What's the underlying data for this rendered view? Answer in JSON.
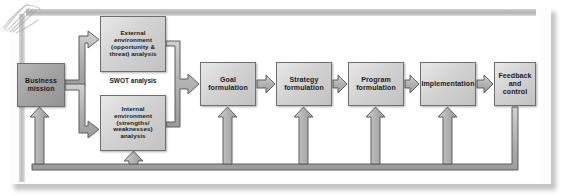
{
  "diagram": {
    "type": "process-flow",
    "nodes": [
      {
        "id": "mission",
        "label": "Business mission",
        "emphasis": "dark"
      },
      {
        "id": "external",
        "label": "External environment (opportunity & threat) analysis",
        "emphasis": "light"
      },
      {
        "id": "internal",
        "label": "Internal environment (strengths/ weaknesses) analysis",
        "emphasis": "light"
      },
      {
        "id": "goal",
        "label": "Goal formulation",
        "emphasis": "light"
      },
      {
        "id": "strategy",
        "label": "Strategy formulation",
        "emphasis": "light"
      },
      {
        "id": "program",
        "label": "Program formulation",
        "emphasis": "light"
      },
      {
        "id": "implement",
        "label": "Implementation",
        "emphasis": "light"
      },
      {
        "id": "feedback",
        "label": "Feedback and control",
        "emphasis": "light"
      }
    ],
    "labels": {
      "swot": "SWOT analysis"
    },
    "node_text": {
      "mission": [
        "Business",
        "mission"
      ],
      "external": [
        "External",
        "environment",
        "(opportunity &",
        "threat) analysis"
      ],
      "internal": [
        "Internal",
        "environment",
        "(strengths/",
        "weaknesses) analysis"
      ],
      "goal": [
        "Goal",
        "formulation"
      ],
      "strategy": [
        "Strategy",
        "formulation"
      ],
      "program": [
        "Program",
        "formulation"
      ],
      "implement": [
        "Implementation"
      ],
      "feedback": [
        "Feedback",
        "and",
        "control"
      ]
    },
    "edges": [
      {
        "from": "mission",
        "to": "external",
        "style": "block-arrow"
      },
      {
        "from": "mission",
        "to": "internal",
        "style": "block-arrow"
      },
      {
        "from": "external",
        "to": "goal",
        "style": "block-arrow-merged"
      },
      {
        "from": "internal",
        "to": "goal",
        "style": "block-arrow-merged"
      },
      {
        "from": "goal",
        "to": "strategy",
        "style": "block-arrow"
      },
      {
        "from": "strategy",
        "to": "program",
        "style": "block-arrow"
      },
      {
        "from": "program",
        "to": "implement",
        "style": "block-arrow"
      },
      {
        "from": "implement",
        "to": "feedback",
        "style": "block-arrow"
      },
      {
        "from": "feedback",
        "to": "mission",
        "style": "feedback-loop"
      },
      {
        "from": "feedback",
        "to": "internal",
        "style": "feedback-loop"
      },
      {
        "from": "feedback",
        "to": "goal",
        "style": "feedback-loop"
      },
      {
        "from": "feedback",
        "to": "strategy",
        "style": "feedback-loop"
      },
      {
        "from": "feedback",
        "to": "program",
        "style": "feedback-loop"
      },
      {
        "from": "feedback",
        "to": "implement",
        "style": "feedback-loop"
      }
    ],
    "colors": {
      "node_fill_light": "#d4d4d4",
      "node_fill_dark": "#a4a4a4",
      "node_border": "#6e6e6e",
      "arrow_fill": "#b5b5b5",
      "arrow_border": "#5d5d5d",
      "frame": "#bdbdbd",
      "page_background": "#ffffff",
      "text": "#1a1a1a"
    }
  }
}
